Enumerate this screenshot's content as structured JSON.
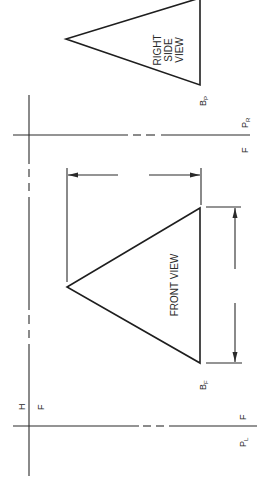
{
  "diagram": {
    "type": "orthographic-projection",
    "orientation": "rotated 90 degrees clockwise",
    "views": {
      "right_side": {
        "label_lines": [
          "RIGHT",
          "SIDE",
          "VIEW"
        ],
        "point_label": "B",
        "point_sub": "P"
      },
      "front": {
        "label": "FRONT VIEW",
        "point_label": "B",
        "point_sub": "F"
      }
    },
    "fold_lines": {
      "top": {
        "left_label": "F",
        "right_label": "P",
        "right_sub": "R"
      },
      "bottom": {
        "left_label": "F",
        "right_label": "P",
        "right_sub": "L"
      },
      "vertical": {
        "upper_label": "H",
        "lower_label": "F"
      }
    },
    "dimensions": {
      "horizontal": "width of front view",
      "vertical": "height of front view"
    },
    "colors": {
      "ink": "#1e1e1e",
      "paper": "#ffffff"
    }
  }
}
